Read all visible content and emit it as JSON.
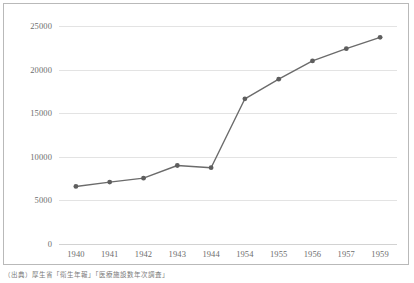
{
  "chart_data": {
    "type": "line",
    "title": "",
    "subtitle": "",
    "xlabel": "",
    "ylabel": "",
    "categories": [
      "1940",
      "1941",
      "1942",
      "1943",
      "1944",
      "1954",
      "1955",
      "1956",
      "1957",
      "1959"
    ],
    "values": [
      6600,
      7100,
      7550,
      9000,
      8750,
      16650,
      18900,
      21000,
      22400,
      23700
    ],
    "series": [
      {
        "name": "",
        "values": [
          6600,
          7100,
          7550,
          9000,
          8750,
          16650,
          18900,
          21000,
          22400,
          23700
        ]
      }
    ],
    "ylim": [
      0,
      25000
    ],
    "yticks": [
      0,
      5000,
      10000,
      15000,
      20000,
      25000
    ],
    "ytick_labels": [
      "0",
      "5000",
      "10000",
      "15000",
      "20000",
      "25000"
    ],
    "grid": true,
    "legend": false,
    "legend_position": "none",
    "marker": "circle",
    "line_color": "#6b6b6b",
    "marker_color": "#5e5e5e",
    "grid_color": "#e3e3e3",
    "axis_label_color": "#6d6d6d"
  },
  "caption": {
    "text": "（出典）厚生省「衛生年報」「医療施設数年次調査」"
  },
  "colors": {
    "frame_border": "#b9b9b9",
    "background": "#ffffff",
    "series": "#6b6b6b"
  }
}
